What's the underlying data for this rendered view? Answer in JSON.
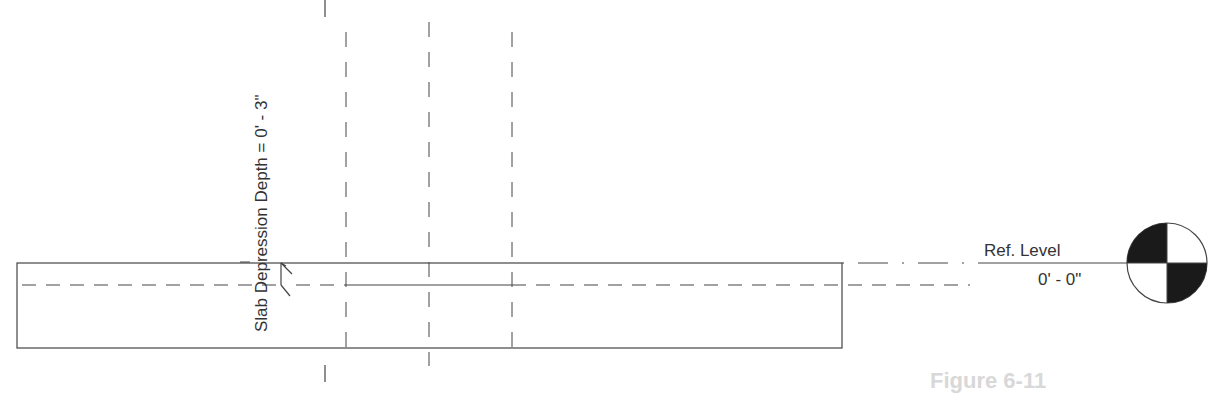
{
  "drawing": {
    "type": "section-view",
    "annotation": {
      "slab_depression_label": "Slab Depression Depth = 0' - 3\""
    },
    "level_marker": {
      "name": "Ref. Level",
      "elevation": "0' - 0\""
    },
    "caption": "Figure 6-11"
  },
  "colors": {
    "line": "#444444",
    "fill_dark": "#1a1a1a",
    "background": "#ffffff"
  }
}
